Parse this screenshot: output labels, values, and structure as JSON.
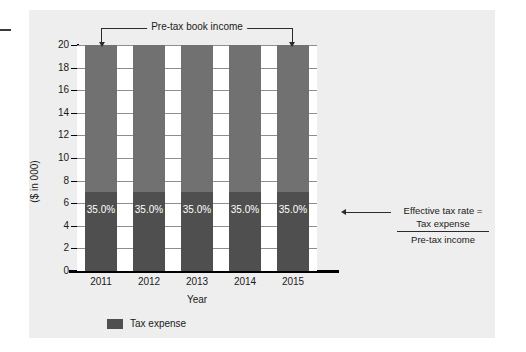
{
  "chart_data": {
    "type": "bar",
    "title": "",
    "subtitle": "",
    "xlabel": "Year",
    "ylabel": "($ in 000)",
    "categories": [
      "2011",
      "2012",
      "2013",
      "2014",
      "2015"
    ],
    "ylim": [
      0,
      20
    ],
    "ytick_labels": [
      "0",
      "2",
      "4",
      "6",
      "8",
      "10",
      "12",
      "14",
      "16",
      "18",
      "20"
    ],
    "ytick_step": 2,
    "grid": true,
    "legend_position": "bottom-left",
    "stacked": true,
    "series": [
      {
        "name": "Tax expense",
        "color": "#4f4f4f",
        "values": [
          7,
          7,
          7,
          7,
          7
        ],
        "data_labels": [
          "35.0%",
          "35.0%",
          "35.0%",
          "35.0%",
          "35.0%"
        ]
      },
      {
        "name": "Pre-tax book income remainder",
        "color": "#717171",
        "values": [
          13,
          13,
          13,
          13,
          13
        ],
        "data_labels": [
          "",
          "",
          "",
          "",
          ""
        ]
      }
    ],
    "totals": [
      20,
      20,
      20,
      20,
      20
    ],
    "annotations": [
      {
        "id": "top-bracket",
        "text": "Pre-tax book income",
        "style": "bracket-with-arrows",
        "spans_categories": [
          "2011",
          "2015"
        ]
      },
      {
        "id": "formula-callout",
        "heading": "Effective tax rate =",
        "numerator": "Tax expense",
        "denominator": "Pre-tax income",
        "points_at": "2015"
      }
    ]
  },
  "legend": {
    "items": [
      {
        "label": "Tax expense",
        "color": "#4f4f4f"
      }
    ]
  },
  "axes": {
    "y_title": "($ in 000)",
    "x_title": "Year"
  },
  "annotation_top": {
    "label": "Pre-tax book income"
  },
  "annotation_right": {
    "heading": "Effective tax rate =",
    "numerator": "Tax expense",
    "denominator": "Pre-tax income"
  },
  "colors": {
    "panel_background": "#eeeeee",
    "plot_background": "#ffffff",
    "bar_tax_expense": "#4f4f4f",
    "bar_pretax_remainder": "#717171",
    "gridline": "#8d8d8d",
    "axis": "#000000",
    "text": "#1a1a1a"
  }
}
